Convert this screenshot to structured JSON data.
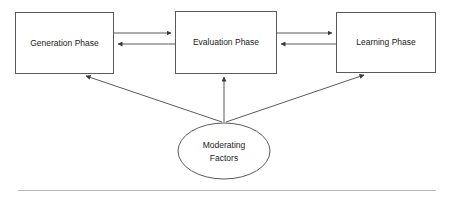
{
  "diagram": {
    "type": "flow-diagram",
    "background_color": "#ffffff",
    "stroke_color": "#5a5a5a",
    "text_color": "#222222",
    "rule_color": "#b8b8b8",
    "nodes": [
      {
        "id": "generation",
        "shape": "rectangle",
        "label": "Generation Phase",
        "x": 15,
        "y": 12,
        "width": 98,
        "height": 61
      },
      {
        "id": "evaluation",
        "shape": "rectangle",
        "label": "Evaluation Phase",
        "x": 175,
        "y": 11,
        "width": 101,
        "height": 62
      },
      {
        "id": "learning",
        "shape": "rectangle",
        "label": "Learning Phase",
        "x": 336,
        "y": 12,
        "width": 99,
        "height": 60
      },
      {
        "id": "moderating",
        "shape": "ellipse",
        "label_line_1": "Moderating",
        "label_line_2": "Factors",
        "cx": 224,
        "cy": 151,
        "rx": 46,
        "ry": 28
      }
    ],
    "edges": [
      {
        "id": "generation-to-evaluation",
        "from": "generation",
        "to": "evaluation",
        "direction": "right",
        "arrowhead": "end"
      },
      {
        "id": "evaluation-to-generation",
        "from": "evaluation",
        "to": "generation",
        "direction": "left",
        "arrowhead": "end"
      },
      {
        "id": "evaluation-to-learning",
        "from": "evaluation",
        "to": "learning",
        "direction": "right",
        "arrowhead": "end"
      },
      {
        "id": "learning-to-evaluation",
        "from": "learning",
        "to": "evaluation",
        "direction": "left",
        "arrowhead": "end"
      },
      {
        "id": "moderating-to-generation",
        "from": "moderating",
        "to": "generation",
        "direction": "up-left",
        "arrowhead": "end"
      },
      {
        "id": "moderating-to-evaluation",
        "from": "moderating",
        "to": "evaluation",
        "direction": "up",
        "arrowhead": "end"
      },
      {
        "id": "moderating-to-learning",
        "from": "moderating",
        "to": "learning",
        "direction": "up-right",
        "arrowhead": "end"
      }
    ],
    "footer_rule": {
      "x1": 18,
      "x2": 436,
      "y": 190
    }
  }
}
